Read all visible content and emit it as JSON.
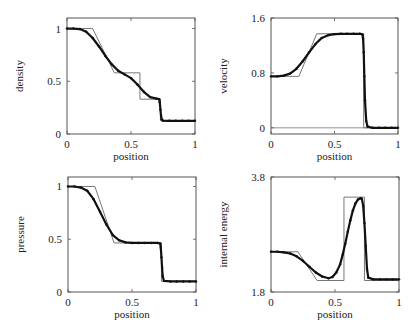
{
  "chart_data": [
    {
      "id": "density",
      "type": "line",
      "title": "",
      "xlabel": "position",
      "ylabel": "density",
      "xlim": [
        0,
        1
      ],
      "ylim": [
        0,
        1.1
      ],
      "xticks": [
        0,
        0.5,
        1
      ],
      "xtick_labels": [
        "0",
        "0.5",
        "1"
      ],
      "yticks": [
        0,
        0.5,
        1
      ],
      "ytick_labels": [
        "0",
        "0.5",
        "1"
      ],
      "grid": false,
      "box": {
        "left": 67,
        "top": 18,
        "right": 195,
        "bottom": 134
      },
      "series": [
        {
          "name": "exact",
          "style": "line",
          "color": "#777777",
          "x": [
            0,
            0.2,
            0.37,
            0.57,
            0.57,
            0.73,
            0.73,
            1
          ],
          "y": [
            1.0,
            1.0,
            0.58,
            0.58,
            0.33,
            0.33,
            0.125,
            0.125
          ]
        },
        {
          "name": "numerical",
          "style": "points",
          "color": "#111111",
          "x": [
            0,
            0.05,
            0.1,
            0.15,
            0.2,
            0.25,
            0.3,
            0.35,
            0.4,
            0.45,
            0.5,
            0.55,
            0.6,
            0.65,
            0.7,
            0.72,
            0.725,
            0.73,
            0.735,
            0.74,
            0.75,
            0.8,
            0.85,
            0.9,
            0.95,
            1
          ],
          "y": [
            1.0,
            1.0,
            0.995,
            0.97,
            0.91,
            0.83,
            0.74,
            0.66,
            0.6,
            0.565,
            0.53,
            0.47,
            0.4,
            0.35,
            0.335,
            0.33,
            0.3,
            0.23,
            0.17,
            0.14,
            0.126,
            0.125,
            0.125,
            0.125,
            0.125,
            0.125
          ]
        }
      ]
    },
    {
      "id": "velocity",
      "type": "line",
      "title": "",
      "xlabel": "position",
      "ylabel": "velocity",
      "xlim": [
        0,
        1
      ],
      "ylim": [
        -0.09,
        1.6
      ],
      "xticks": [
        0,
        0.5,
        1
      ],
      "xtick_labels": [
        "0",
        "0.5",
        "1"
      ],
      "yticks": [
        0,
        0.8,
        1.6
      ],
      "ytick_labels": [
        "0",
        "0.8",
        "1.6"
      ],
      "zero_line": true,
      "grid": false,
      "box": {
        "left": 271,
        "top": 18,
        "right": 398,
        "bottom": 134
      },
      "series": [
        {
          "name": "exact",
          "style": "line",
          "color": "#777777",
          "x": [
            0,
            0.22,
            0.36,
            0.73,
            0.73,
            1
          ],
          "y": [
            0.75,
            0.75,
            1.37,
            1.37,
            0.0,
            0.0
          ]
        },
        {
          "name": "numerical",
          "style": "points",
          "color": "#111111",
          "x": [
            0,
            0.05,
            0.1,
            0.15,
            0.2,
            0.25,
            0.3,
            0.35,
            0.4,
            0.45,
            0.5,
            0.55,
            0.6,
            0.65,
            0.7,
            0.72,
            0.725,
            0.73,
            0.735,
            0.74,
            0.75,
            0.76,
            0.8,
            0.85,
            0.9,
            0.95,
            1
          ],
          "y": [
            0.75,
            0.75,
            0.76,
            0.79,
            0.86,
            0.97,
            1.1,
            1.22,
            1.31,
            1.35,
            1.365,
            1.37,
            1.37,
            1.37,
            1.37,
            1.36,
            1.3,
            1.1,
            0.75,
            0.4,
            0.1,
            0.02,
            0.0,
            0.0,
            0.0,
            0.0,
            0.0
          ]
        }
      ]
    },
    {
      "id": "pressure",
      "type": "line",
      "title": "",
      "xlabel": "position",
      "ylabel": "pressure",
      "xlim": [
        0,
        1
      ],
      "ylim": [
        0,
        1.09
      ],
      "xticks": [
        0,
        0.5,
        1
      ],
      "xtick_labels": [
        "0",
        "0.5",
        "1"
      ],
      "yticks": [
        0,
        0.5,
        1
      ],
      "ytick_labels": [
        "0",
        "0.5",
        "1"
      ],
      "grid": false,
      "box": {
        "left": 68,
        "top": 177,
        "right": 196,
        "bottom": 292
      },
      "series": [
        {
          "name": "exact",
          "style": "line",
          "color": "#777777",
          "x": [
            0,
            0.21,
            0.36,
            0.73,
            0.73,
            1
          ],
          "y": [
            1.0,
            1.0,
            0.465,
            0.465,
            0.1,
            0.1
          ]
        },
        {
          "name": "numerical",
          "style": "points",
          "color": "#111111",
          "x": [
            0,
            0.05,
            0.1,
            0.15,
            0.2,
            0.25,
            0.3,
            0.35,
            0.4,
            0.45,
            0.5,
            0.55,
            0.6,
            0.65,
            0.7,
            0.72,
            0.725,
            0.73,
            0.735,
            0.74,
            0.75,
            0.8,
            0.85,
            0.9,
            0.95,
            1
          ],
          "y": [
            1.0,
            1.0,
            0.99,
            0.96,
            0.88,
            0.76,
            0.64,
            0.54,
            0.49,
            0.47,
            0.465,
            0.465,
            0.465,
            0.465,
            0.465,
            0.46,
            0.42,
            0.33,
            0.23,
            0.15,
            0.105,
            0.1,
            0.1,
            0.1,
            0.1,
            0.1
          ]
        }
      ]
    },
    {
      "id": "internal-energy",
      "type": "line",
      "title": "",
      "xlabel": "position",
      "ylabel": "internal energy",
      "xlim": [
        0,
        1
      ],
      "ylim": [
        1.8,
        3.8
      ],
      "xticks": [
        0,
        0.5,
        1
      ],
      "xtick_labels": [
        "0",
        "0.5",
        "1"
      ],
      "yticks": [
        1.8,
        3.8
      ],
      "ytick_labels": [
        "1.8",
        "3.8"
      ],
      "grid": false,
      "box": {
        "left": 271,
        "top": 177,
        "right": 399,
        "bottom": 292
      },
      "series": [
        {
          "name": "exact",
          "style": "line",
          "color": "#777777",
          "x": [
            0,
            0.21,
            0.36,
            0.57,
            0.57,
            0.73,
            0.73,
            1
          ],
          "y": [
            2.5,
            2.5,
            2.0,
            2.0,
            3.45,
            3.45,
            2.0,
            2.0
          ]
        },
        {
          "name": "numerical",
          "style": "points",
          "color": "#111111",
          "x": [
            0,
            0.05,
            0.1,
            0.15,
            0.2,
            0.25,
            0.3,
            0.35,
            0.4,
            0.45,
            0.48,
            0.51,
            0.54,
            0.56,
            0.58,
            0.6,
            0.62,
            0.64,
            0.66,
            0.68,
            0.7,
            0.71,
            0.72,
            0.73,
            0.74,
            0.75,
            0.76,
            0.8,
            0.85,
            0.9,
            0.95,
            1
          ],
          "y": [
            2.5,
            2.5,
            2.49,
            2.47,
            2.42,
            2.34,
            2.24,
            2.14,
            2.07,
            2.04,
            2.06,
            2.14,
            2.28,
            2.45,
            2.64,
            2.85,
            3.05,
            3.22,
            3.34,
            3.41,
            3.43,
            3.42,
            3.3,
            3.0,
            2.6,
            2.2,
            2.05,
            2.02,
            2.02,
            2.02,
            2.02,
            2.02
          ]
        }
      ]
    }
  ]
}
